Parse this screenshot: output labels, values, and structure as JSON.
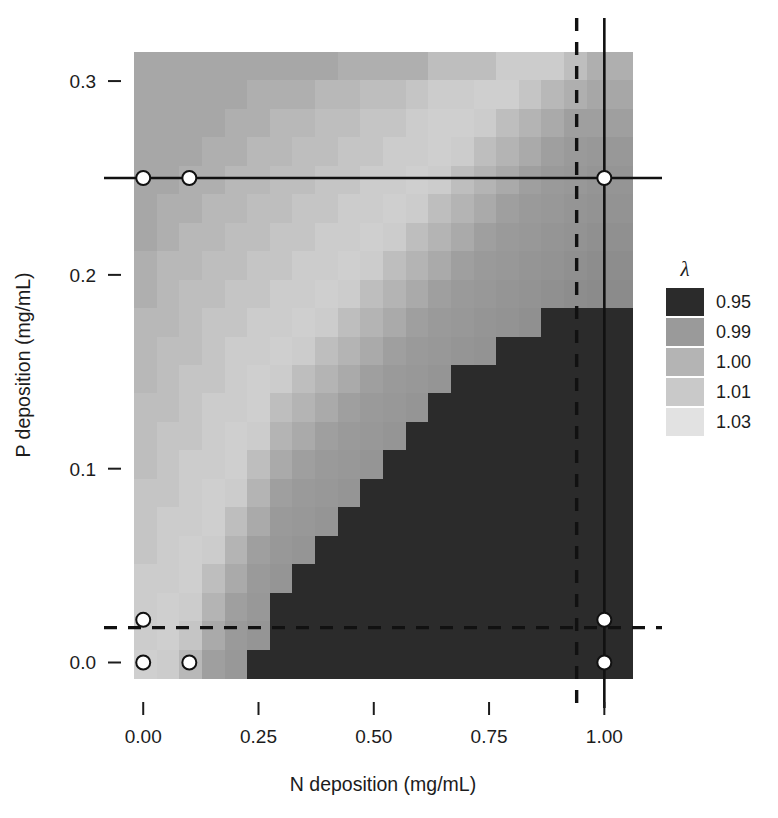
{
  "chart_data": {
    "type": "heatmap",
    "title": "",
    "xlabel": "N deposition (mg/mL)",
    "ylabel": "P deposition (mg/mL)",
    "xticks": [
      "0.00",
      "0.25",
      "0.50",
      "0.75",
      "1.00"
    ],
    "xtick_values": [
      0.0,
      0.25,
      0.5,
      0.75,
      1.0
    ],
    "yticks": [
      "0.0",
      "0.1",
      "0.2",
      "0.3"
    ],
    "ytick_values": [
      0.0,
      0.1,
      0.2,
      0.3
    ],
    "xlim": [
      -0.02,
      1.06
    ],
    "ylim": [
      -0.008,
      0.315
    ],
    "grid": false,
    "legend": {
      "position": "right",
      "title": "λ",
      "entries": [
        {
          "label": "0.95",
          "color": "#2b2b2b"
        },
        {
          "label": "0.99",
          "color": "#9a9a9a"
        },
        {
          "label": "1.00",
          "color": "#b4b4b4"
        },
        {
          "label": "1.01",
          "color": "#c9c9c9"
        },
        {
          "label": "1.03",
          "color": "#e2e2e2"
        }
      ]
    },
    "z_label": "λ",
    "z_breaks": [
      0.95,
      0.99,
      1.0,
      1.01,
      1.03
    ],
    "nx": 22,
    "ny": 22,
    "cell_values_note": "lambda grid, rows top (P=0.315) to bottom (P=0.0), columns left (N=0.0) to right (N=1.06)",
    "grid_values": [
      [
        0.995,
        0.995,
        0.995,
        0.995,
        0.995,
        0.995,
        0.995,
        0.995,
        0.995,
        0.998,
        0.998,
        0.998,
        0.998,
        1.005,
        1.005,
        1.005,
        1.012,
        1.012,
        1.012,
        1.005,
        0.998,
        0.998
      ],
      [
        0.995,
        0.995,
        0.995,
        0.995,
        0.995,
        0.998,
        0.998,
        0.998,
        1.002,
        1.002,
        1.005,
        1.005,
        1.008,
        1.012,
        1.012,
        1.015,
        1.015,
        1.008,
        1.002,
        0.998,
        0.995,
        0.995
      ],
      [
        0.995,
        0.995,
        0.995,
        0.995,
        0.998,
        0.998,
        1.002,
        1.002,
        1.005,
        1.005,
        1.008,
        1.008,
        1.012,
        1.015,
        1.015,
        1.012,
        1.005,
        1.0,
        0.996,
        0.992,
        0.992,
        0.992
      ],
      [
        0.995,
        0.995,
        0.995,
        0.998,
        0.998,
        1.002,
        1.002,
        1.005,
        1.005,
        1.008,
        1.008,
        1.012,
        1.012,
        1.015,
        1.012,
        1.005,
        1.0,
        0.996,
        0.992,
        0.99,
        0.988,
        0.988
      ],
      [
        0.995,
        0.995,
        0.998,
        0.998,
        1.002,
        1.002,
        1.005,
        1.005,
        1.008,
        1.008,
        1.012,
        1.012,
        1.015,
        1.012,
        1.005,
        1.0,
        0.996,
        0.992,
        0.99,
        0.988,
        0.986,
        0.986
      ],
      [
        0.995,
        0.998,
        0.998,
        1.002,
        1.002,
        1.005,
        1.005,
        1.008,
        1.008,
        1.012,
        1.012,
        1.015,
        1.012,
        1.005,
        1.0,
        0.996,
        0.992,
        0.99,
        0.988,
        0.986,
        0.984,
        0.984
      ],
      [
        0.995,
        0.998,
        1.002,
        1.002,
        1.005,
        1.005,
        1.008,
        1.008,
        1.012,
        1.012,
        1.015,
        1.012,
        1.005,
        1.0,
        0.996,
        0.992,
        0.99,
        0.988,
        0.986,
        0.984,
        0.982,
        0.982
      ],
      [
        0.998,
        1.002,
        1.002,
        1.005,
        1.005,
        1.008,
        1.008,
        1.012,
        1.012,
        1.015,
        1.012,
        1.005,
        1.0,
        0.996,
        0.992,
        0.99,
        0.988,
        0.986,
        0.984,
        0.982,
        0.98,
        0.98
      ],
      [
        0.998,
        1.002,
        1.005,
        1.005,
        1.008,
        1.008,
        1.012,
        1.012,
        1.015,
        1.012,
        1.005,
        1.0,
        0.996,
        0.992,
        0.99,
        0.988,
        0.986,
        0.984,
        0.982,
        0.98,
        0.978,
        0.978
      ],
      [
        1.002,
        1.002,
        1.005,
        1.008,
        1.008,
        1.012,
        1.012,
        1.015,
        1.012,
        1.005,
        1.0,
        0.996,
        0.992,
        0.99,
        0.988,
        0.986,
        0.984,
        0.982,
        0.94,
        0.94,
        0.94,
        0.94
      ],
      [
        1.002,
        1.005,
        1.005,
        1.008,
        1.012,
        1.012,
        1.015,
        1.012,
        1.005,
        1.0,
        0.996,
        0.992,
        0.99,
        0.988,
        0.986,
        0.984,
        0.94,
        0.94,
        0.94,
        0.94,
        0.94,
        0.94
      ],
      [
        1.002,
        1.005,
        1.008,
        1.008,
        1.012,
        1.015,
        1.012,
        1.005,
        1.0,
        0.996,
        0.992,
        0.99,
        0.988,
        0.986,
        0.94,
        0.94,
        0.94,
        0.94,
        0.94,
        0.94,
        0.94,
        0.94
      ],
      [
        1.005,
        1.005,
        1.008,
        1.012,
        1.012,
        1.015,
        1.005,
        1.0,
        0.996,
        0.992,
        0.99,
        0.988,
        0.986,
        0.94,
        0.94,
        0.94,
        0.94,
        0.94,
        0.94,
        0.94,
        0.94,
        0.94
      ],
      [
        1.005,
        1.008,
        1.008,
        1.012,
        1.015,
        1.012,
        1.0,
        0.996,
        0.992,
        0.99,
        0.988,
        0.986,
        0.94,
        0.94,
        0.94,
        0.94,
        0.94,
        0.94,
        0.94,
        0.94,
        0.94,
        0.94
      ],
      [
        1.005,
        1.008,
        1.012,
        1.012,
        1.015,
        1.005,
        0.996,
        0.992,
        0.99,
        0.988,
        0.986,
        0.94,
        0.94,
        0.94,
        0.94,
        0.94,
        0.94,
        0.94,
        0.94,
        0.94,
        0.94,
        0.94
      ],
      [
        1.008,
        1.008,
        1.012,
        1.015,
        1.012,
        1.0,
        0.992,
        0.99,
        0.988,
        0.986,
        0.94,
        0.94,
        0.94,
        0.94,
        0.94,
        0.94,
        0.94,
        0.94,
        0.94,
        0.94,
        0.94,
        0.94
      ],
      [
        1.008,
        1.012,
        1.012,
        1.015,
        1.005,
        0.996,
        0.99,
        0.988,
        0.986,
        0.94,
        0.94,
        0.94,
        0.94,
        0.94,
        0.94,
        0.94,
        0.94,
        0.94,
        0.94,
        0.94,
        0.94,
        0.94
      ],
      [
        1.008,
        1.012,
        1.015,
        1.012,
        1.0,
        0.992,
        0.988,
        0.986,
        0.94,
        0.94,
        0.94,
        0.94,
        0.94,
        0.94,
        0.94,
        0.94,
        0.94,
        0.94,
        0.94,
        0.94,
        0.94,
        0.94
      ],
      [
        1.012,
        1.012,
        1.015,
        1.005,
        0.996,
        0.99,
        0.986,
        0.94,
        0.94,
        0.94,
        0.94,
        0.94,
        0.94,
        0.94,
        0.94,
        0.94,
        0.94,
        0.94,
        0.94,
        0.94,
        0.94,
        0.94
      ],
      [
        1.012,
        1.015,
        1.012,
        1.0,
        0.992,
        0.988,
        0.94,
        0.94,
        0.94,
        0.94,
        0.94,
        0.94,
        0.94,
        0.94,
        0.94,
        0.94,
        0.94,
        0.94,
        0.94,
        0.94,
        0.94,
        0.94
      ],
      [
        1.012,
        1.015,
        1.008,
        0.996,
        0.99,
        0.986,
        0.94,
        0.94,
        0.94,
        0.94,
        0.94,
        0.94,
        0.94,
        0.94,
        0.94,
        0.94,
        0.94,
        0.94,
        0.94,
        0.94,
        0.94,
        0.94
      ],
      [
        1.015,
        1.012,
        1.002,
        0.992,
        0.988,
        0.94,
        0.94,
        0.94,
        0.94,
        0.94,
        0.94,
        0.94,
        0.94,
        0.94,
        0.94,
        0.94,
        0.94,
        0.94,
        0.94,
        0.94,
        0.94,
        0.94
      ]
    ],
    "reference_lines": [
      {
        "orientation": "horizontal",
        "value": 0.25,
        "style": "solid"
      },
      {
        "orientation": "vertical",
        "value": 1.0,
        "style": "solid"
      },
      {
        "orientation": "horizontal",
        "value": 0.018,
        "style": "dashed"
      },
      {
        "orientation": "vertical",
        "value": 0.94,
        "style": "dashed"
      }
    ],
    "points": [
      {
        "x": 0.0,
        "y": 0.25
      },
      {
        "x": 0.1,
        "y": 0.25
      },
      {
        "x": 1.0,
        "y": 0.25
      },
      {
        "x": 0.0,
        "y": 0.022
      },
      {
        "x": 0.0,
        "y": 0.0
      },
      {
        "x": 0.1,
        "y": 0.0
      },
      {
        "x": 1.0,
        "y": 0.022
      },
      {
        "x": 1.0,
        "y": 0.0
      }
    ],
    "point_style": {
      "fill": "#ffffff",
      "stroke": "#111111",
      "radius": 7
    }
  }
}
